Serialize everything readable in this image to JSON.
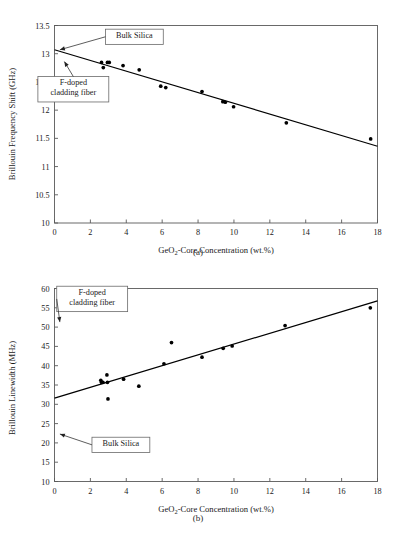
{
  "figure": {
    "caption": "",
    "subcaption_a": "(a)",
    "subcaption_b": "(b)"
  },
  "chart_data": [
    {
      "id": "panel-a",
      "type": "scatter",
      "title": "",
      "xlabel": "GeO2-Core Concentration (wt.%)",
      "xlabel_rich": [
        "GeO",
        "2",
        "-Core Concentration (wt.%)"
      ],
      "ylabel": "Brillouin Frequency Shift (GHz)",
      "xlim": [
        0,
        18
      ],
      "ylim": [
        10,
        13.5
      ],
      "xticks": [
        0,
        2,
        4,
        6,
        8,
        10,
        12,
        14,
        16,
        18
      ],
      "xticklabels": [
        "0",
        "2",
        "4",
        "6",
        "8",
        "10",
        "12",
        "14",
        "16",
        "18"
      ],
      "yticks": [
        10,
        10.5,
        11,
        11.5,
        12,
        12.5,
        13,
        13.5
      ],
      "yticklabels": [
        "10",
        "10.5",
        "11",
        "11.5",
        "12",
        "12.5",
        "13",
        "13.5"
      ],
      "grid": false,
      "legend": "none",
      "series": [
        {
          "name": "Brillouin frequency shift measurements",
          "marker": "filled-circle",
          "color": "#000000",
          "points": [
            {
              "x": 2.62,
              "y": 12.845
            },
            {
              "x": 2.72,
              "y": 12.755
            },
            {
              "x": 2.95,
              "y": 12.845
            },
            {
              "x": 3.05,
              "y": 12.845
            },
            {
              "x": 3.82,
              "y": 12.79
            },
            {
              "x": 4.72,
              "y": 12.715
            },
            {
              "x": 5.92,
              "y": 12.425
            },
            {
              "x": 6.2,
              "y": 12.4
            },
            {
              "x": 8.22,
              "y": 12.33
            },
            {
              "x": 9.38,
              "y": 12.15
            },
            {
              "x": 9.52,
              "y": 12.14
            },
            {
              "x": 9.98,
              "y": 12.06
            },
            {
              "x": 12.92,
              "y": 11.775
            },
            {
              "x": 17.62,
              "y": 11.49
            }
          ]
        }
      ],
      "fit_line": {
        "name": "linear fit",
        "x_start": 0.0,
        "y_start": 13.07,
        "x_end": 18.0,
        "y_end": 11.36,
        "slope": -0.095,
        "intercept": 13.07
      },
      "annotations": [
        {
          "label": "Bulk Silica",
          "label_lines": [
            "Bulk Silica"
          ],
          "box_x": 4.45,
          "box_y": 13.3,
          "point_x": 0.3,
          "point_y": 13.07,
          "arrow": true
        },
        {
          "label": "F-doped cladding fiber",
          "label_lines": [
            "F-doped",
            "cladding fiber"
          ],
          "box_x": 1.05,
          "box_y": 12.37,
          "point_x": 0.55,
          "point_y": 12.86,
          "arrow": true
        }
      ]
    },
    {
      "id": "panel-b",
      "type": "scatter",
      "title": "",
      "xlabel": "GeO2-Core Concentration (wt.%)",
      "xlabel_rich": [
        "GeO",
        "2",
        "-Core Concentration (wt.%)"
      ],
      "ylabel": "Brillouin Linewidth (MHz)",
      "xlim": [
        0,
        18
      ],
      "ylim": [
        10,
        60
      ],
      "xticks": [
        0,
        2,
        4,
        6,
        8,
        10,
        12,
        14,
        16,
        18
      ],
      "xticklabels": [
        "0",
        "2",
        "4",
        "6",
        "8",
        "10",
        "12",
        "14",
        "16",
        "18"
      ],
      "yticks": [
        10,
        15,
        20,
        25,
        30,
        35,
        40,
        45,
        50,
        55,
        60
      ],
      "yticklabels": [
        "10",
        "15",
        "20",
        "25",
        "30",
        "35",
        "40",
        "45",
        "50",
        "55",
        "60"
      ],
      "grid": false,
      "legend": "none",
      "series": [
        {
          "name": "Brillouin linewidth measurements",
          "marker": "filled-circle",
          "color": "#000000",
          "points": [
            {
              "x": 2.58,
              "y": 36.2
            },
            {
              "x": 2.62,
              "y": 35.7
            },
            {
              "x": 2.7,
              "y": 35.7
            },
            {
              "x": 2.92,
              "y": 37.6
            },
            {
              "x": 2.95,
              "y": 35.7
            },
            {
              "x": 2.98,
              "y": 31.4
            },
            {
              "x": 3.85,
              "y": 36.5
            },
            {
              "x": 4.7,
              "y": 34.7
            },
            {
              "x": 6.1,
              "y": 40.5
            },
            {
              "x": 6.52,
              "y": 46.0
            },
            {
              "x": 8.22,
              "y": 42.2
            },
            {
              "x": 9.4,
              "y": 44.5
            },
            {
              "x": 9.9,
              "y": 45.1
            },
            {
              "x": 12.85,
              "y": 50.4
            },
            {
              "x": 17.6,
              "y": 55.0
            }
          ]
        }
      ],
      "fit_line": {
        "name": "linear fit",
        "x_start": 0.0,
        "y_start": 31.6,
        "x_end": 18.0,
        "y_end": 56.8,
        "slope": 1.4,
        "intercept": 31.6
      },
      "annotations": [
        {
          "label": "F-doped cladding fiber",
          "label_lines": [
            "F-doped",
            "cladding fiber"
          ],
          "box_x": 2.1,
          "box_y": 57.3,
          "point_x": 0.3,
          "point_y": 51.3,
          "arrow": true
        },
        {
          "label": "Bulk Silica",
          "label_lines": [
            "Bulk Silica"
          ],
          "box_x": 3.7,
          "box_y": 19.5,
          "point_x": 0.3,
          "point_y": 22.3,
          "arrow": true
        }
      ]
    }
  ]
}
